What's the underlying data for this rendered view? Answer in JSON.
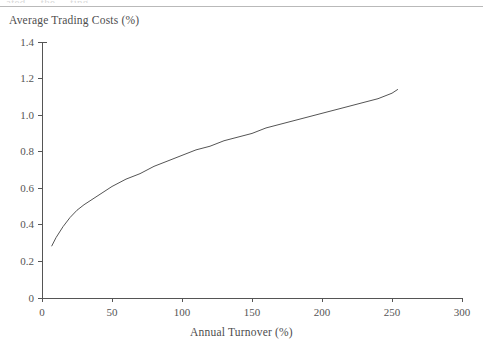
{
  "figure": {
    "cropped_header_text": "ated ... the ... ting",
    "y_axis_title": "Average Trading Costs (%)",
    "x_axis_title": "Annual Turnover (%)"
  },
  "chart_data": {
    "type": "line",
    "title": "",
    "subtitle": "",
    "xlabel": "Annual Turnover (%)",
    "ylabel": "Average Trading Costs (%)",
    "xlim": [
      0,
      300
    ],
    "ylim": [
      0,
      1.4
    ],
    "xticks": [
      0,
      50,
      100,
      150,
      200,
      250,
      300
    ],
    "xtick_labels": [
      "0",
      "50",
      "100",
      "150",
      "200",
      "250",
      "300"
    ],
    "yticks": [
      0,
      0.2,
      0.4,
      0.6,
      0.8,
      1.0,
      1.2,
      1.4
    ],
    "ytick_labels": [
      "0",
      "0.2",
      "0.4",
      "0.6",
      "0.8",
      "1.0",
      "1.2",
      "1.4"
    ],
    "grid": false,
    "legend": null,
    "line_color": "#555555",
    "series": [
      {
        "name": "Average Trading Costs",
        "x": [
          7,
          10,
          15,
          20,
          25,
          30,
          40,
          50,
          60,
          70,
          80,
          90,
          100,
          110,
          120,
          130,
          140,
          150,
          160,
          170,
          180,
          190,
          200,
          210,
          220,
          230,
          240,
          250,
          254
        ],
        "y": [
          0.285,
          0.33,
          0.39,
          0.44,
          0.48,
          0.51,
          0.56,
          0.61,
          0.65,
          0.68,
          0.72,
          0.75,
          0.78,
          0.81,
          0.83,
          0.86,
          0.88,
          0.9,
          0.93,
          0.95,
          0.97,
          0.99,
          1.01,
          1.03,
          1.05,
          1.07,
          1.09,
          1.12,
          1.14
        ]
      }
    ],
    "annotations": []
  }
}
